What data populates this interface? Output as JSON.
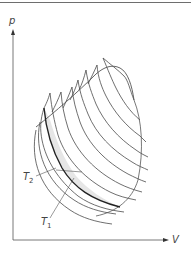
{
  "diagram": {
    "axes": {
      "y_label": "p",
      "x_label": "V"
    },
    "labels": {
      "t2": "T",
      "t2_sub": "2",
      "t1": "T",
      "t1_sub": "1"
    },
    "colors": {
      "line": "#4a4a4a",
      "bold_line": "#222222",
      "shade": "#e6e6e6",
      "frame": "#6e6e6e"
    }
  }
}
